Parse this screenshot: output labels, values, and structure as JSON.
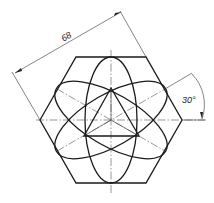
{
  "drawing": {
    "title": "Regular hexagon with three inscribed ellipses",
    "dimension_label": "68",
    "angle_label": "30°",
    "stroke_color": "#1a1a1a",
    "background": "#ffffff"
  }
}
